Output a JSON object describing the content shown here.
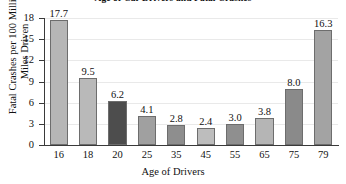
{
  "chart_data": {
    "type": "bar",
    "title": "Age of Car Drivers and Fatal Crashes",
    "xlabel": "Age of Drivers",
    "ylabel_line1": "Fatal Crashes per 100 Million",
    "ylabel_line2": "Miles Driven",
    "categories": [
      "16",
      "18",
      "20",
      "25",
      "35",
      "45",
      "55",
      "65",
      "75",
      "79"
    ],
    "values": [
      17.7,
      9.5,
      6.2,
      4.1,
      2.8,
      2.4,
      3.0,
      3.8,
      8.0,
      16.3
    ],
    "value_labels": [
      "17.7",
      "9.5",
      "6.2",
      "4.1",
      "2.8",
      "2.4",
      "3.0",
      "3.8",
      "8.0",
      "16.3"
    ],
    "bar_colors": [
      "#b6b6b6",
      "#b9b9b9",
      "#4d4d4d",
      "#a0a0a0",
      "#8e8e8e",
      "#bdbdbd",
      "#8f8f8f",
      "#b5b5b5",
      "#8a8a8a",
      "#a3a3a3"
    ],
    "ylim": [
      0,
      18
    ],
    "yticks": [
      0,
      3,
      6,
      9,
      12,
      15,
      18
    ],
    "ytick_labels": [
      "0",
      "3",
      "6",
      "9",
      "12",
      "15",
      "18"
    ],
    "grid": true,
    "legend": null
  }
}
